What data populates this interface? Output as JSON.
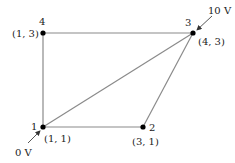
{
  "diagram": {
    "nodes": [
      {
        "id": "1",
        "label": "1",
        "coord": "(1, 1)",
        "x": 43,
        "y": 127
      },
      {
        "id": "2",
        "label": "2",
        "coord": "(3, 1)",
        "x": 143,
        "y": 127
      },
      {
        "id": "3",
        "label": "3",
        "coord": "(4, 3)",
        "x": 193,
        "y": 33
      },
      {
        "id": "4",
        "label": "4",
        "coord": "(1, 3)",
        "x": 43,
        "y": 33
      }
    ],
    "edges": [
      [
        "1",
        "2"
      ],
      [
        "2",
        "3"
      ],
      [
        "3",
        "4"
      ],
      [
        "4",
        "1"
      ],
      [
        "1",
        "3"
      ]
    ],
    "boundary_conditions": {
      "node3": "10 V",
      "node1": "0 V"
    },
    "colors": {
      "edge": "#8a8a8a",
      "node": "#000000",
      "text": "#222222"
    }
  }
}
